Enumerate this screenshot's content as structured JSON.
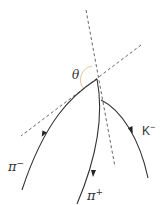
{
  "diagram": {
    "type": "particle-decay-topology",
    "angle_label": "θ",
    "tracks": [
      {
        "id": "pi-minus",
        "label": "π",
        "charge": "−"
      },
      {
        "id": "pi-plus",
        "label": "π",
        "charge": "+"
      },
      {
        "id": "k-minus",
        "label": "K",
        "charge": "−"
      }
    ],
    "colors": {
      "track": "#333333",
      "dashed": "#444444",
      "arc": "#e0c090"
    }
  }
}
